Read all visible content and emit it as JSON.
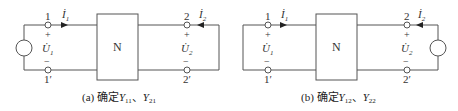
{
  "figures": [
    {
      "id": "a",
      "block_label": "N",
      "port1": {
        "top_terminal": "1",
        "bottom_terminal": "1′",
        "current": "İ",
        "current_sub": "1",
        "voltage": "U̇",
        "voltage_sub": "1",
        "plus": "+",
        "minus": "−"
      },
      "port2": {
        "top_terminal": "2",
        "bottom_terminal": "2′",
        "current": "İ",
        "current_sub": "2",
        "voltage": "U̇",
        "voltage_sub": "2",
        "plus": "+",
        "minus": "−"
      },
      "source_side": "left",
      "caption": {
        "prefix": "(a) 确定",
        "y1": "Y",
        "y1_sub": "11",
        "sep": "、",
        "y2": "Y",
        "y2_sub": "21"
      }
    },
    {
      "id": "b",
      "block_label": "N",
      "port1": {
        "top_terminal": "1",
        "bottom_terminal": "1′",
        "current": "İ",
        "current_sub": "1",
        "voltage": "U̇",
        "voltage_sub": "1",
        "plus": "+",
        "minus": "−"
      },
      "port2": {
        "top_terminal": "2",
        "bottom_terminal": "2′",
        "current": "İ",
        "current_sub": "2",
        "voltage": "U̇",
        "voltage_sub": "2",
        "plus": "+",
        "minus": "−"
      },
      "source_side": "right",
      "caption": {
        "prefix": "(b) 确定",
        "y1": "Y",
        "y1_sub": "12",
        "sep": "、",
        "y2": "Y",
        "y2_sub": "22"
      }
    }
  ],
  "colors": {
    "wire": "#555555",
    "text": "#333333"
  }
}
